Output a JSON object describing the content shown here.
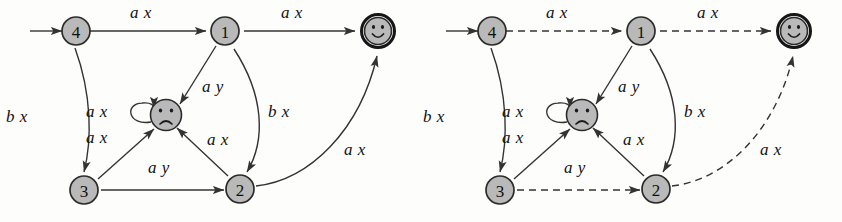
{
  "figure": {
    "caption": "",
    "panel_count": 2
  },
  "colors": {
    "state_fill": "#b9b9b9",
    "stroke": "#333333",
    "text": "#111111",
    "background": "#fdfdfc"
  },
  "states": {
    "four": "4",
    "one": "1",
    "two": "2",
    "three": "3",
    "accept": "happy-face",
    "reject": "sad-face"
  },
  "panels": [
    {
      "id": "left",
      "name": "automaton-all-solid",
      "edges": [
        {
          "id": "start-to-4",
          "label": "",
          "style": "solid"
        },
        {
          "id": "4-to-1",
          "label": "a x",
          "style": "solid"
        },
        {
          "id": "1-to-accept",
          "label": "a x",
          "style": "solid"
        },
        {
          "id": "4-to-3",
          "label": "b x",
          "style": "solid"
        },
        {
          "id": "1-to-reject",
          "label": "a y",
          "style": "solid"
        },
        {
          "id": "1-to-2",
          "label": "b x",
          "style": "solid"
        },
        {
          "id": "reject-self",
          "label": "a x",
          "style": "solid"
        },
        {
          "id": "3-to-reject",
          "label": "a x",
          "style": "solid"
        },
        {
          "id": "2-to-reject",
          "label": "a x",
          "style": "solid"
        },
        {
          "id": "3-to-2",
          "label": "a y",
          "style": "solid"
        },
        {
          "id": "2-to-accept",
          "label": "a x",
          "style": "solid"
        }
      ]
    },
    {
      "id": "right",
      "name": "automaton-highlighted-path",
      "edges": [
        {
          "id": "start-to-4",
          "label": "",
          "style": "solid"
        },
        {
          "id": "4-to-1",
          "label": "a x",
          "style": "dashed"
        },
        {
          "id": "1-to-accept",
          "label": "a x",
          "style": "dashed"
        },
        {
          "id": "4-to-3",
          "label": "b x",
          "style": "solid"
        },
        {
          "id": "1-to-reject",
          "label": "a y",
          "style": "solid"
        },
        {
          "id": "1-to-2",
          "label": "b x",
          "style": "solid"
        },
        {
          "id": "reject-self",
          "label": "a x",
          "style": "solid"
        },
        {
          "id": "3-to-reject",
          "label": "a x",
          "style": "solid"
        },
        {
          "id": "2-to-reject",
          "label": "a x",
          "style": "solid"
        },
        {
          "id": "3-to-2",
          "label": "a y",
          "style": "dashed"
        },
        {
          "id": "2-to-accept",
          "label": "a x",
          "style": "dashed"
        }
      ]
    }
  ],
  "labels": {
    "ax": "a x",
    "ay": "a y",
    "bx": "b x"
  }
}
